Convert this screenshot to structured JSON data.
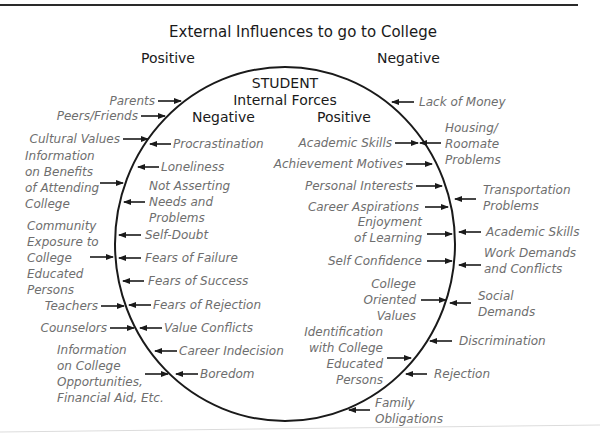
{
  "diagram": {
    "title": "External Influences to go to College",
    "external_positive_heading": "Positive",
    "external_negative_heading": "Negative",
    "inner": {
      "title_line1": "STUDENT",
      "title_line2": "Internal Forces",
      "negative_heading": "Negative",
      "positive_heading": "Positive"
    },
    "external_positive": [
      [
        "Parents"
      ],
      [
        "Peers/Friends"
      ],
      [
        "Cultural Values"
      ],
      [
        "Information",
        "on Benefits",
        "of Attending",
        "College"
      ],
      [
        "Community",
        "Exposure to",
        "College",
        "Educated",
        "Persons"
      ],
      [
        "Teachers"
      ],
      [
        "Counselors"
      ],
      [
        "Information",
        "on College",
        "Opportunities,",
        "Financial Aid, Etc."
      ]
    ],
    "internal_negative": [
      [
        "Procrastination"
      ],
      [
        "Loneliness"
      ],
      [
        "Not Asserting",
        "Needs and",
        "Problems"
      ],
      [
        "Self-Doubt"
      ],
      [
        "Fears of Failure"
      ],
      [
        "Fears of Success"
      ],
      [
        "Fears of Rejection"
      ],
      [
        "Value Conflicts"
      ],
      [
        "Career Indecision"
      ],
      [
        "Boredom"
      ]
    ],
    "internal_positive": [
      [
        "Academic Skills"
      ],
      [
        "Achievement Motives"
      ],
      [
        "Personal Interests"
      ],
      [
        "Career Aspirations"
      ],
      [
        "Enjoyment",
        "of Learning"
      ],
      [
        "Self Confidence"
      ],
      [
        "College",
        "Oriented",
        "Values"
      ],
      [
        "Identification",
        "with College",
        "Educated",
        "Persons"
      ]
    ],
    "external_negative": [
      [
        "Lack of Money"
      ],
      [
        "Housing/",
        "Roomate",
        "Problems"
      ],
      [
        "Transportation",
        "Problems"
      ],
      [
        "Academic Skills"
      ],
      [
        "Work Demands",
        "and Conflicts"
      ],
      [
        "Social",
        "Demands"
      ],
      [
        "Discrimination"
      ],
      [
        "Rejection"
      ],
      [
        "Family",
        "Obligations"
      ]
    ]
  }
}
